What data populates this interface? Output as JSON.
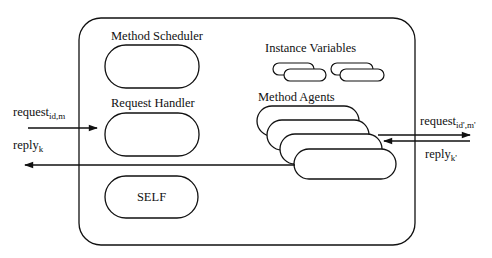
{
  "diagram": {
    "title": "",
    "components": {
      "method_scheduler": {
        "label": "Method Scheduler"
      },
      "request_handler": {
        "label": "Request Handler"
      },
      "self": {
        "label": "SELF"
      },
      "instance_variables": {
        "label": "Instance Variables"
      },
      "method_agents": {
        "label": "Method Agents"
      }
    },
    "arrows": {
      "incoming_request": {
        "base": "request",
        "sub": "id,m",
        "direction": "right"
      },
      "outgoing_reply": {
        "base": "reply",
        "sub": "k",
        "direction": "left"
      },
      "outgoing_request": {
        "base": "request",
        "sub": "id',m'",
        "direction": "right"
      },
      "incoming_reply": {
        "base": "reply",
        "sub": "k'",
        "direction": "left"
      }
    },
    "colors": {
      "stroke": "#111111",
      "background": "#ffffff"
    }
  }
}
